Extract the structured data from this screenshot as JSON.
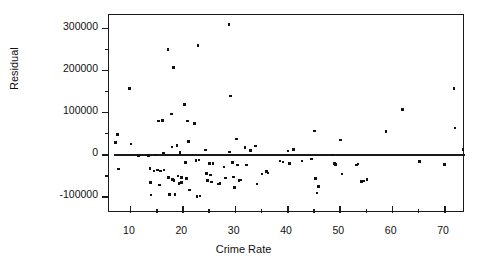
{
  "chart_data": {
    "type": "scatter",
    "title": "",
    "xlabel": "Crime Rate",
    "ylabel": "Residual",
    "xlim": [
      6,
      74
    ],
    "ylim": [
      -140000,
      330000
    ],
    "xticks": [
      10,
      20,
      30,
      40,
      50,
      60,
      70
    ],
    "xtick_labels": [
      "10",
      "20",
      "30",
      "40",
      "50",
      "60",
      "70"
    ],
    "yticks": [
      -100000,
      0,
      100000,
      200000,
      300000
    ],
    "ytick_labels": [
      "-100000",
      "0",
      "100000",
      "200000",
      "300000"
    ],
    "grid": false,
    "legend": null,
    "reference_line": {
      "type": "horizontal",
      "y": 0,
      "x_start": 7,
      "x_end": 74
    },
    "marker": {
      "shape": "square",
      "color": "#111111",
      "size_px": 2.6
    },
    "series": [
      {
        "name": "Residuals",
        "points": [
          [
            7.2,
            28000
          ],
          [
            7.6,
            47000
          ],
          [
            7.8,
            -36000
          ],
          [
            9.9,
            155000
          ],
          [
            10.2,
            24000
          ],
          [
            11.6,
            -3000
          ],
          [
            13.6,
            -4000
          ],
          [
            13.8,
            -35000
          ],
          [
            13.9,
            -68000
          ],
          [
            14.0,
            -97000
          ],
          [
            14.6,
            -40000
          ],
          [
            14.9,
            -2000
          ],
          [
            15.3,
            -38000
          ],
          [
            15.5,
            78000
          ],
          [
            15.6,
            -74000
          ],
          [
            15.8,
            -40000
          ],
          [
            16.2,
            80000
          ],
          [
            16.4,
            2000
          ],
          [
            16.5,
            -38000
          ],
          [
            17.3,
            248000
          ],
          [
            17.4,
            -56000
          ],
          [
            17.6,
            -96000
          ],
          [
            17.9,
            95000
          ],
          [
            18.0,
            17000
          ],
          [
            18.1,
            -60000
          ],
          [
            18.3,
            205000
          ],
          [
            18.4,
            -63000
          ],
          [
            18.6,
            -96000
          ],
          [
            19.0,
            20000
          ],
          [
            19.2,
            -52000
          ],
          [
            19.4,
            -70000
          ],
          [
            19.6,
            3000
          ],
          [
            19.8,
            -56000
          ],
          [
            19.9,
            -68000
          ],
          [
            20.4,
            117000
          ],
          [
            20.6,
            -20000
          ],
          [
            20.8,
            -58000
          ],
          [
            21.0,
            78000
          ],
          [
            21.2,
            30000
          ],
          [
            21.4,
            -85000
          ],
          [
            22.3,
            73000
          ],
          [
            22.6,
            -15000
          ],
          [
            22.8,
            -101000
          ],
          [
            23.0,
            258000
          ],
          [
            23.2,
            -14000
          ],
          [
            23.4,
            -100000
          ],
          [
            24.4,
            10000
          ],
          [
            24.6,
            -46000
          ],
          [
            24.8,
            -63000
          ],
          [
            25.2,
            -22000
          ],
          [
            25.4,
            -50000
          ],
          [
            25.6,
            -66000
          ],
          [
            25.9,
            -22000
          ],
          [
            26.8,
            -71000
          ],
          [
            27.2,
            -70000
          ],
          [
            28.0,
            -31000
          ],
          [
            28.2,
            -57000
          ],
          [
            28.9,
            308000
          ],
          [
            29.0,
            5000
          ],
          [
            29.2,
            138000
          ],
          [
            29.6,
            -20000
          ],
          [
            29.8,
            -55000
          ],
          [
            30.0,
            -80000
          ],
          [
            30.3,
            36000
          ],
          [
            30.6,
            -26000
          ],
          [
            30.8,
            -63000
          ],
          [
            31.1,
            -62000
          ],
          [
            32.0,
            15000
          ],
          [
            32.3,
            -26000
          ],
          [
            33.0,
            9000
          ],
          [
            34.0,
            19000
          ],
          [
            34.3,
            -71000
          ],
          [
            35.2,
            -47000
          ],
          [
            36.1,
            -41000
          ],
          [
            36.4,
            -45000
          ],
          [
            38.7,
            -17000
          ],
          [
            39.2,
            -19000
          ],
          [
            40.2,
            7000
          ],
          [
            40.5,
            -22000
          ],
          [
            41.2,
            11000
          ],
          [
            42.9,
            -17000
          ],
          [
            44.7,
            -12000
          ],
          [
            45.3,
            55000
          ],
          [
            45.5,
            -58000
          ],
          [
            45.7,
            -93000
          ],
          [
            46.0,
            -77000
          ],
          [
            48.7,
            -2000
          ],
          [
            49.1,
            -22000
          ],
          [
            49.3,
            -25000
          ],
          [
            50.2,
            33000
          ],
          [
            50.5,
            -47000
          ],
          [
            53.3,
            -26000
          ],
          [
            53.6,
            -24000
          ],
          [
            54.2,
            -65000
          ],
          [
            54.6,
            -64000
          ],
          [
            55.3,
            -60000
          ],
          [
            58.9,
            53000
          ],
          [
            62.1,
            105000
          ],
          [
            65.3,
            -18000
          ],
          [
            70.1,
            -25000
          ],
          [
            71.9,
            155000
          ],
          [
            72.1,
            62000
          ],
          [
            73.6,
            11000
          ]
        ]
      }
    ]
  },
  "axes": {
    "y_title": "Residual",
    "x_title": "Crime Rate"
  }
}
